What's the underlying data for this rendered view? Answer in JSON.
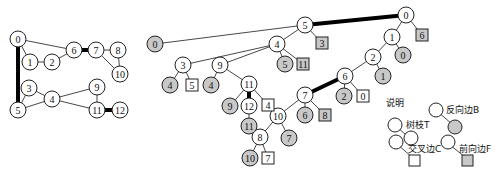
{
  "graph": {
    "nodes": [
      {
        "id": "0",
        "x": 18,
        "y": 39
      },
      {
        "id": "1",
        "x": 30,
        "y": 62
      },
      {
        "id": "2",
        "x": 52,
        "y": 62
      },
      {
        "id": "6",
        "x": 74,
        "y": 50
      },
      {
        "id": "7",
        "x": 96,
        "y": 50
      },
      {
        "id": "8",
        "x": 118,
        "y": 50
      },
      {
        "id": "10",
        "x": 120,
        "y": 74
      },
      {
        "id": "3",
        "x": 29,
        "y": 88
      },
      {
        "id": "4",
        "x": 52,
        "y": 99
      },
      {
        "id": "5",
        "x": 18,
        "y": 110
      },
      {
        "id": "9",
        "x": 97,
        "y": 87
      },
      {
        "id": "11",
        "x": 97,
        "y": 110
      },
      {
        "id": "12",
        "x": 120,
        "y": 110
      }
    ],
    "edges": [
      [
        "0",
        "1",
        0
      ],
      [
        "1",
        "2",
        0
      ],
      [
        "2",
        "6",
        0
      ],
      [
        "0",
        "6",
        0
      ],
      [
        "6",
        "7",
        1
      ],
      [
        "7",
        "8",
        0
      ],
      [
        "8",
        "10",
        0
      ],
      [
        "7",
        "10",
        0
      ],
      [
        "0",
        "5",
        1
      ],
      [
        "5",
        "3",
        0
      ],
      [
        "3",
        "4",
        0
      ],
      [
        "5",
        "4",
        0
      ],
      [
        "4",
        "9",
        0
      ],
      [
        "4",
        "11",
        0
      ],
      [
        "9",
        "11",
        0
      ],
      [
        "11",
        "12",
        1
      ]
    ]
  },
  "dfs_tree": {
    "nodes": [
      {
        "id": "n0",
        "label": "0",
        "x": 406,
        "y": 15,
        "t": "node"
      },
      {
        "id": "n6s",
        "label": "6",
        "x": 422,
        "y": 35,
        "t": "fsq"
      },
      {
        "id": "n1",
        "label": "1",
        "x": 392,
        "y": 37,
        "t": "node"
      },
      {
        "id": "n0g",
        "label": "0",
        "x": 403,
        "y": 55,
        "t": "back"
      },
      {
        "id": "n2",
        "label": "2",
        "x": 373,
        "y": 57,
        "t": "node"
      },
      {
        "id": "n1g",
        "label": "1",
        "x": 383,
        "y": 76,
        "t": "back"
      },
      {
        "id": "n6",
        "label": "6",
        "x": 345,
        "y": 76,
        "t": "node"
      },
      {
        "id": "n2g",
        "label": "2",
        "x": 344,
        "y": 96,
        "t": "back"
      },
      {
        "id": "n0s",
        "label": "0",
        "x": 363,
        "y": 96,
        "t": "csq"
      },
      {
        "id": "n7",
        "label": "7",
        "x": 305,
        "y": 95,
        "t": "node"
      },
      {
        "id": "n6g",
        "label": "6",
        "x": 305,
        "y": 115,
        "t": "back"
      },
      {
        "id": "n8s",
        "label": "8",
        "x": 325,
        "y": 115,
        "t": "fsq"
      },
      {
        "id": "n10",
        "label": "10",
        "x": 278,
        "y": 116,
        "t": "node"
      },
      {
        "id": "n7g",
        "label": "7",
        "x": 289,
        "y": 138,
        "t": "back"
      },
      {
        "id": "n8",
        "label": "8",
        "x": 260,
        "y": 137,
        "t": "node"
      },
      {
        "id": "n10g",
        "label": "10",
        "x": 250,
        "y": 158,
        "t": "back"
      },
      {
        "id": "n7s",
        "label": "7",
        "x": 268,
        "y": 158,
        "t": "csq"
      },
      {
        "id": "n5",
        "label": "5",
        "x": 305,
        "y": 25,
        "t": "node"
      },
      {
        "id": "n0b",
        "label": "0",
        "x": 155,
        "y": 44,
        "t": "back"
      },
      {
        "id": "n3s",
        "label": "3",
        "x": 322,
        "y": 43,
        "t": "fsq"
      },
      {
        "id": "n4",
        "label": "4",
        "x": 277,
        "y": 44,
        "t": "node"
      },
      {
        "id": "n5g",
        "label": "5",
        "x": 285,
        "y": 64,
        "t": "back"
      },
      {
        "id": "n11s",
        "label": "11",
        "x": 303,
        "y": 64,
        "t": "fsq"
      },
      {
        "id": "n3",
        "label": "3",
        "x": 183,
        "y": 65,
        "t": "node"
      },
      {
        "id": "n4g",
        "label": "4",
        "x": 170,
        "y": 85,
        "t": "back"
      },
      {
        "id": "n5s",
        "label": "5",
        "x": 192,
        "y": 85,
        "t": "csq"
      },
      {
        "id": "n9",
        "label": "9",
        "x": 220,
        "y": 65,
        "t": "node"
      },
      {
        "id": "n4g2",
        "label": "4",
        "x": 211,
        "y": 85,
        "t": "back"
      },
      {
        "id": "n11",
        "label": "11",
        "x": 249,
        "y": 84,
        "t": "node"
      },
      {
        "id": "n9g",
        "label": "9",
        "x": 230,
        "y": 106,
        "t": "back"
      },
      {
        "id": "n12",
        "label": "12",
        "x": 249,
        "y": 106,
        "t": "node"
      },
      {
        "id": "n4s",
        "label": "4",
        "x": 268,
        "y": 105,
        "t": "csq"
      },
      {
        "id": "n11g",
        "label": "11",
        "x": 249,
        "y": 126,
        "t": "back"
      }
    ],
    "edges": [
      [
        "n0",
        "n6s",
        0
      ],
      [
        "n0",
        "n1",
        0
      ],
      [
        "n1",
        "n0g",
        0
      ],
      [
        "n1",
        "n2",
        0
      ],
      [
        "n2",
        "n1g",
        0
      ],
      [
        "n2",
        "n6",
        0
      ],
      [
        "n6",
        "n2g",
        0
      ],
      [
        "n6",
        "n0s",
        0
      ],
      [
        "n6",
        "n7",
        1
      ],
      [
        "n7",
        "n6g",
        0
      ],
      [
        "n7",
        "n8s",
        0
      ],
      [
        "n7",
        "n10",
        0
      ],
      [
        "n10",
        "n7g",
        0
      ],
      [
        "n10",
        "n8",
        0
      ],
      [
        "n8",
        "n10g",
        0
      ],
      [
        "n8",
        "n7s",
        0
      ],
      [
        "n0",
        "n5",
        1
      ],
      [
        "n5",
        "n0b",
        0
      ],
      [
        "n5",
        "n3s",
        0
      ],
      [
        "n5",
        "n4",
        0
      ],
      [
        "n4",
        "n5g",
        0
      ],
      [
        "n4",
        "n11s",
        0
      ],
      [
        "n4",
        "n3",
        0
      ],
      [
        "n4",
        "n9",
        0
      ],
      [
        "n3",
        "n4g",
        0
      ],
      [
        "n3",
        "n5s",
        0
      ],
      [
        "n9",
        "n4g2",
        0
      ],
      [
        "n9",
        "n11",
        0
      ],
      [
        "n11",
        "n9g",
        0
      ],
      [
        "n11",
        "n12",
        1
      ],
      [
        "n11",
        "n4s",
        0
      ],
      [
        "n12",
        "n11g",
        0
      ],
      [
        "n12",
        "n8",
        0
      ]
    ]
  },
  "legend": {
    "title": "说明",
    "tree_edge": "树枝T",
    "back_edge": "反向边B",
    "cross_edge": "交叉边C",
    "forward_edge": "前向边F"
  }
}
